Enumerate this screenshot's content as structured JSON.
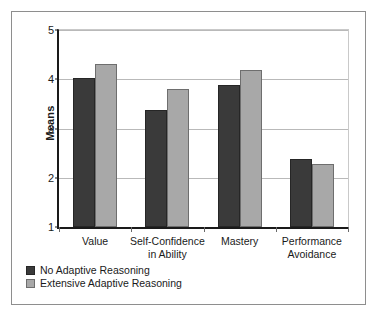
{
  "chart_data": {
    "type": "bar",
    "title": "",
    "xlabel": "",
    "ylabel": "Means",
    "ylim": [
      1,
      5
    ],
    "yticks": [
      1,
      2,
      3,
      4,
      5
    ],
    "ytick_labels": [
      "1",
      "2",
      "3",
      "4",
      "5"
    ],
    "grid": true,
    "legend_position": "below-left",
    "categories": [
      "Value",
      "Self-Confidence\nin Ability",
      "Mastery",
      "Performance\nAvoidance"
    ],
    "series": [
      {
        "name": "No Adaptive Reasoning",
        "color": "#3a3a3a",
        "values": [
          4.03,
          3.38,
          3.88,
          2.38
        ]
      },
      {
        "name": "Extensive Adaptive Reasoning",
        "color": "#a8a8a8",
        "values": [
          4.3,
          3.81,
          4.19,
          2.27
        ]
      }
    ]
  },
  "legend": {
    "items": [
      {
        "label": "No Adaptive Reasoning"
      },
      {
        "label": "Extensive Adaptive Reasoning"
      }
    ]
  }
}
